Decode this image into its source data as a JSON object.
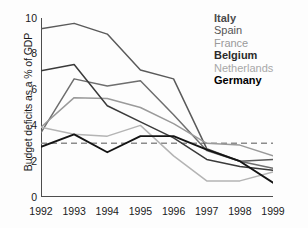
{
  "chart_data": {
    "type": "line",
    "title": "",
    "xlabel": "",
    "ylabel": "Budget deficits as a % of GDP",
    "x": [
      1992,
      1993,
      1994,
      1995,
      1996,
      1997,
      1998,
      1999
    ],
    "xticklabels": [
      "1992",
      "1993",
      "1994",
      "1995",
      "1996",
      "1997",
      "1998",
      "1999"
    ],
    "yticklabels": [
      "0",
      "2",
      "4",
      "6",
      "8",
      "10"
    ],
    "yticks": [
      0,
      2,
      4,
      6,
      8,
      10
    ],
    "xlim": [
      1992,
      1999
    ],
    "ylim": [
      0,
      10
    ],
    "grid": false,
    "legend_position": "top-right",
    "reference_line": {
      "label": "3% Maastricht criterion",
      "value": 3.0,
      "style": "dashed",
      "color": "#8c8c8c"
    },
    "series": [
      {
        "name": "Italy",
        "color": "#5a5a5a",
        "width": 1.5,
        "values": [
          9.4,
          9.7,
          9.1,
          7.1,
          6.6,
          2.7,
          2.0,
          2.1
        ]
      },
      {
        "name": "Spain",
        "color": "#6e6e6e",
        "width": 1.5,
        "values": [
          3.6,
          6.6,
          6.2,
          6.5,
          4.6,
          2.6,
          2.0,
          1.6
        ]
      },
      {
        "name": "France",
        "color": "#9a9a9a",
        "width": 1.5,
        "values": [
          3.9,
          5.55,
          5.5,
          5.0,
          4.1,
          3.0,
          2.9,
          2.3
        ]
      },
      {
        "name": "Belgium",
        "color": "#3a3a3a",
        "width": 1.5,
        "values": [
          7.05,
          7.4,
          5.1,
          4.2,
          3.3,
          2.1,
          1.7,
          1.5
        ]
      },
      {
        "name": "Netherlands",
        "color": "#b4b4b4",
        "width": 1.5,
        "values": [
          3.9,
          3.5,
          3.4,
          4.0,
          2.3,
          0.9,
          0.9,
          1.4
        ]
      },
      {
        "name": "Germany",
        "color": "#141414",
        "width": 1.9,
        "values": [
          2.8,
          3.5,
          2.5,
          3.4,
          3.4,
          2.65,
          2.0,
          0.8
        ]
      }
    ]
  },
  "legend": {
    "entries": [
      {
        "label": "Italy",
        "color": "#4a4a4a",
        "weight": "bold"
      },
      {
        "label": "Spain",
        "color": "#555555",
        "weight": "normal"
      },
      {
        "label": "France",
        "color": "#9a9a9a",
        "weight": "normal"
      },
      {
        "label": "Belgium",
        "color": "#2b2b2b",
        "weight": "bold"
      },
      {
        "label": "Netherlands",
        "color": "#a8a8a8",
        "weight": "normal"
      },
      {
        "label": "Germany",
        "color": "#000000",
        "weight": "bold"
      }
    ]
  },
  "axes": {
    "axis_color": "#4d4d4d",
    "text_color": "#1a1a1a"
  }
}
